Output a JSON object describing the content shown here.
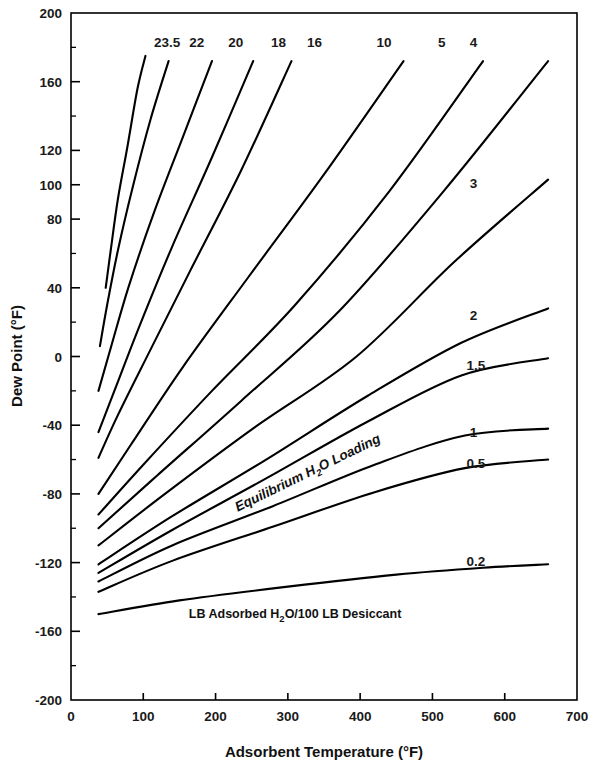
{
  "chart_data": {
    "type": "line",
    "title": "",
    "xlabel": "Adsorbent Temperature (°F)",
    "ylabel": "Dew Point (°F)",
    "xlim": [
      0,
      700
    ],
    "ylim": [
      -200,
      200
    ],
    "grid": false,
    "legend_position": "inline-curve-labels",
    "xticks": [
      0,
      100,
      200,
      300,
      400,
      500,
      600,
      700
    ],
    "xticklabels": [
      "0",
      "100",
      "200",
      "300",
      "400",
      "500",
      "600",
      "700"
    ],
    "yticks": [
      200,
      160,
      120,
      100,
      80,
      40,
      0,
      -40,
      -80,
      -120,
      -160,
      -200
    ],
    "yticklabels": [
      "200",
      "160",
      "120",
      "100",
      "80",
      "40",
      "0",
      "-40",
      "-80",
      "-120",
      "-160",
      "-200"
    ],
    "annotations": [
      {
        "name": "equilibrium-loading-annotation",
        "text": "Equilibrium H",
        "sub": "2",
        "text2": "O Loading",
        "x": 330,
        "y": -70,
        "rotation": -26
      },
      {
        "name": "units-caption",
        "text": "LB Adsorbed H",
        "sub": "2",
        "text2": "O/100 LB Desiccant",
        "x": 310,
        "y": -152
      }
    ],
    "series_label_note": "Each curve is labeled with its equilibrium water loading value (LB adsorbed H2O per 100 LB desiccant)",
    "series": [
      {
        "name": "23.5",
        "label": "23.5",
        "label_x": 133,
        "label_y": 183,
        "x": [
          48,
          55,
          65,
          78,
          92,
          103
        ],
        "values": [
          40,
          62,
          92,
          122,
          156,
          175
        ]
      },
      {
        "name": "22",
        "label": "22",
        "label_x": 174,
        "label_y": 183,
        "x": [
          40,
          50,
          65,
          85,
          110,
          135
        ],
        "values": [
          6,
          30,
          62,
          98,
          138,
          172
        ]
      },
      {
        "name": "20",
        "label": "20",
        "label_x": 228,
        "label_y": 183,
        "x": [
          38,
          55,
          80,
          115,
          155,
          195
        ],
        "values": [
          -20,
          5,
          41,
          84,
          128,
          172
        ]
      },
      {
        "name": "18",
        "label": "18",
        "label_x": 287,
        "label_y": 183,
        "x": [
          38,
          60,
          95,
          140,
          195,
          252
        ],
        "values": [
          -44,
          -20,
          18,
          64,
          116,
          172
        ]
      },
      {
        "name": "16",
        "label": "16",
        "label_x": 337,
        "label_y": 183,
        "x": [
          38,
          65,
          110,
          165,
          235,
          305
        ],
        "values": [
          -59,
          -34,
          4,
          50,
          108,
          172
        ]
      },
      {
        "name": "10",
        "label": "10",
        "label_x": 433,
        "label_y": 183,
        "x": [
          38,
          85,
          155,
          245,
          350,
          460
        ],
        "values": [
          -80,
          -50,
          -6,
          46,
          106,
          172
        ]
      },
      {
        "name": "5",
        "label": "5",
        "label_x": 513,
        "label_y": 183,
        "x": [
          38,
          100,
          195,
          310,
          440,
          570
        ],
        "values": [
          -92,
          -63,
          -20,
          30,
          96,
          172
        ]
      },
      {
        "name": "4",
        "label": "4",
        "label_x": 557,
        "label_y": 183,
        "x": [
          38,
          120,
          235,
          370,
          515,
          660
        ],
        "values": [
          -100,
          -69,
          -26,
          26,
          96,
          172
        ]
      },
      {
        "name": "3",
        "label": "3",
        "label_x": 557,
        "label_y": 101,
        "x": [
          38,
          130,
          255,
          395,
          530,
          660
        ],
        "values": [
          -110,
          -80,
          -41,
          0,
          55,
          103
        ]
      },
      {
        "name": "2",
        "label": "2",
        "label_x": 557,
        "label_y": 24,
        "x": [
          38,
          140,
          270,
          410,
          540,
          660
        ],
        "values": [
          -121,
          -93,
          -60,
          -23,
          8,
          28
        ]
      },
      {
        "name": "1.5",
        "label": "1.5",
        "label_x": 560,
        "label_y": -5,
        "x": [
          38,
          140,
          270,
          410,
          540,
          660
        ],
        "values": [
          -126,
          -101,
          -71,
          -38,
          -11,
          -1
        ]
      },
      {
        "name": "1",
        "label": "1",
        "label_x": 557,
        "label_y": -44,
        "x": [
          38,
          140,
          280,
          420,
          545,
          660
        ],
        "values": [
          -131,
          -110,
          -87,
          -63,
          -46,
          -42
        ]
      },
      {
        "name": "0.5",
        "label": "0.5",
        "label_x": 560,
        "label_y": -62,
        "x": [
          38,
          140,
          280,
          420,
          545,
          660
        ],
        "values": [
          -137,
          -119,
          -99,
          -79,
          -65,
          -60
        ]
      },
      {
        "name": "0.2",
        "label": "0.2",
        "label_x": 560,
        "label_y": -119,
        "x": [
          38,
          150,
          300,
          450,
          570,
          660
        ],
        "values": [
          -150,
          -142,
          -134,
          -127,
          -123,
          -121
        ]
      }
    ]
  },
  "axes": {
    "x_title": "Adsorbent Temperature (°F)",
    "y_title": "Dew Point (°F)"
  }
}
